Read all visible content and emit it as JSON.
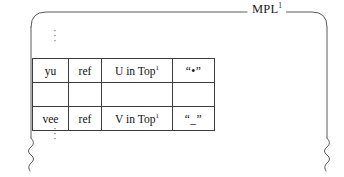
{
  "figure": {
    "frame_title": "MPL",
    "frame_title_superscript": "1",
    "ellipsis_top": "⋮",
    "ellipsis_bottom": "⋮",
    "dot_glyph": "·",
    "colors": {
      "frame_stroke": "#5a5a5a",
      "table_border": "#3c3c3c",
      "shaded_cell_fill": "#c9c9c9",
      "background": "#ffffff",
      "text": "#111111"
    }
  },
  "table": {
    "columns": [
      "name",
      "kind",
      "scope",
      "token"
    ],
    "rows": [
      {
        "name": "yu",
        "kind": "ref",
        "scope_text": "U in Top",
        "scope_superscript": "1",
        "token": "“•”",
        "token_shaded": true
      },
      {
        "name": "vee",
        "kind": "ref",
        "scope_text": "V in Top",
        "scope_superscript": "1",
        "token": "“_”",
        "token_shaded": true
      }
    ]
  }
}
